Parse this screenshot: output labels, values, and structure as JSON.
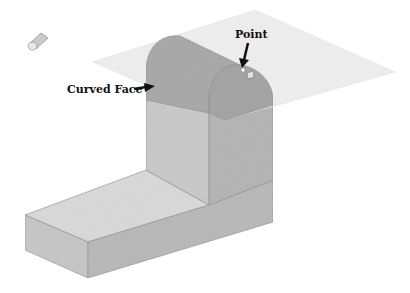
{
  "figure": {
    "callouts": [
      {
        "id": "point",
        "text": "Point"
      },
      {
        "id": "curved-face",
        "text": "Curved Face"
      }
    ],
    "icon": "cylinder-feature-icon",
    "colors": {
      "plane": "#ececec",
      "curved_face": "#a9a9a9",
      "front_face": "#b5b5b5",
      "side_face": "#c8c8c8",
      "base_top": "#d9d9d9",
      "base_front": "#c4c4c4",
      "base_side": "#b3b3b3",
      "edge": "#8a8a8a",
      "text": "#111111"
    }
  }
}
